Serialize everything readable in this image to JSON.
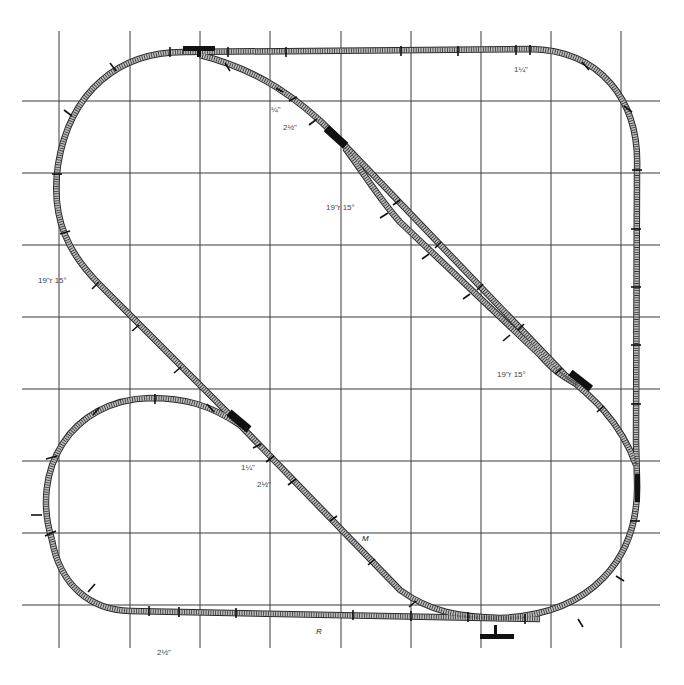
{
  "diagram": {
    "type": "model railroad track plan",
    "grid": {
      "columns": 9,
      "rows": 8
    },
    "labels": [
      {
        "id": "label-top-right-1q",
        "text": "1¼\""
      },
      {
        "id": "label-upper-1q",
        "text": "¼\""
      },
      {
        "id": "label-upper-2h",
        "text": "2½\""
      },
      {
        "id": "label-upper-radius",
        "text": "19\"r 15°"
      },
      {
        "id": "label-left-radius",
        "text": "19\"r 15°"
      },
      {
        "id": "label-right-radius",
        "text": "19\"r 15°"
      },
      {
        "id": "label-mid-1q",
        "text": "1¼\""
      },
      {
        "id": "label-mid-2h",
        "text": "2½\""
      },
      {
        "id": "label-m",
        "text": "M"
      },
      {
        "id": "label-r",
        "text": "R"
      },
      {
        "id": "label-bottom-2h",
        "text": "2½\""
      }
    ],
    "switches": [
      "top-left turnout",
      "upper diagonal turnout",
      "right diagonal turnout",
      "right side turnout",
      "bottom turnout",
      "left loop turnout"
    ],
    "caption": "··· ··· ···"
  },
  "colors": {
    "grid": "#3a3a3a",
    "track": "#bdbdbd",
    "ties": "#333333",
    "switch": "#111111"
  }
}
